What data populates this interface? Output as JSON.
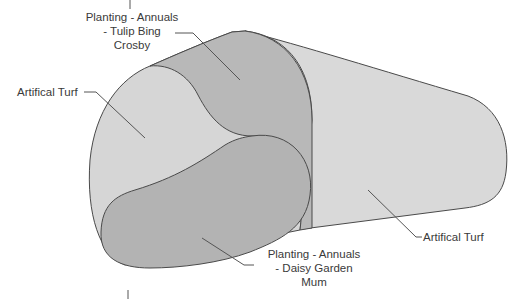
{
  "diagram": {
    "title": "",
    "colors": {
      "background": "#ffffff",
      "turf_fill": "#d6d6d6",
      "turf_right_fill": "#d9d9d9",
      "planting_fill": "#b5b5b5",
      "outline": "#4a4a4a",
      "leader": "#555555",
      "text": "#3a3a3a"
    },
    "regions": [
      {
        "id": "turf-left",
        "name": "Artifical Turf"
      },
      {
        "id": "turf-right",
        "name": "Artifical Turf"
      },
      {
        "id": "planting-tulip",
        "name": "Planting - Annuals - Tulip Bing Crosby"
      },
      {
        "id": "planting-daisy",
        "name": "Planting - Annuals - Daisy Garden Mum"
      }
    ],
    "labels": {
      "tulip": {
        "lines": [
          "Planting - Annuals",
          "- Tulip Bing",
          "Crosby"
        ]
      },
      "turf_left": {
        "text": "Artifical Turf"
      },
      "turf_right": {
        "text": "Artifical Turf"
      },
      "daisy": {
        "lines": [
          "Planting - Annuals",
          "- Daisy Garden",
          "Mum"
        ]
      }
    }
  }
}
